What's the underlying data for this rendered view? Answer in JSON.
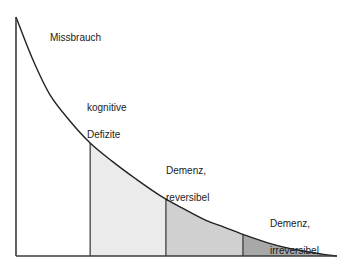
{
  "chart_data": {
    "type": "area",
    "title": "",
    "xlabel": "",
    "ylabel": "",
    "xlim": [
      0,
      1
    ],
    "ylim": [
      0,
      1
    ],
    "grid": false,
    "legend": "none",
    "curve": {
      "x": [
        0.0,
        0.053,
        0.106,
        0.168,
        0.231,
        0.299,
        0.374,
        0.449,
        0.523,
        0.592,
        0.648,
        0.72,
        0.798,
        0.878,
        0.953,
        1.0
      ],
      "y": [
        1.0,
        0.82,
        0.674,
        0.565,
        0.473,
        0.397,
        0.322,
        0.253,
        0.197,
        0.149,
        0.121,
        0.084,
        0.05,
        0.025,
        0.008,
        0.0
      ]
    },
    "zones": [
      {
        "name": "Missbrauch",
        "x_start": 0.0,
        "x_end": 0.231,
        "fill": "#ffffff"
      },
      {
        "name": "kognitive Defizite",
        "x_start": 0.231,
        "x_end": 0.467,
        "fill": "#ebebeb"
      },
      {
        "name": "Demenz, reversibel",
        "x_start": 0.467,
        "x_end": 0.707,
        "fill": "#d0d0d0"
      },
      {
        "name": "Demenz, irreversibel",
        "x_start": 0.707,
        "x_end": 1.0,
        "fill": "#a8a8a8"
      }
    ],
    "annotations": [
      {
        "text": "Missbrauch",
        "x": 0.106,
        "y": 0.98
      },
      {
        "text": "kognitive Defizite",
        "x": 0.221,
        "y": 0.67
      },
      {
        "text": "Demenz, reversibel",
        "x": 0.467,
        "y": 0.45
      },
      {
        "text": "Demenz, irreversibel",
        "x": 0.791,
        "y": 0.23
      }
    ]
  },
  "labels": {
    "missbrauch": {
      "lines": [
        "Missbrauch"
      ]
    },
    "kognitive": {
      "lines": [
        "kognitive",
        "Defizite"
      ]
    },
    "reversibel": {
      "lines": [
        "Demenz,",
        "reversibel"
      ]
    },
    "irreversibel": {
      "lines": [
        "Demenz,",
        "irreversibel"
      ]
    }
  },
  "colors": {
    "axis": "#3a3a3a",
    "curve": "#222222",
    "divider": "#333333",
    "zone_1": "#ffffff",
    "zone_2": "#ebebeb",
    "zone_3": "#d0d0d0",
    "zone_4": "#a8a8a8",
    "text": "#1a1a1a"
  }
}
